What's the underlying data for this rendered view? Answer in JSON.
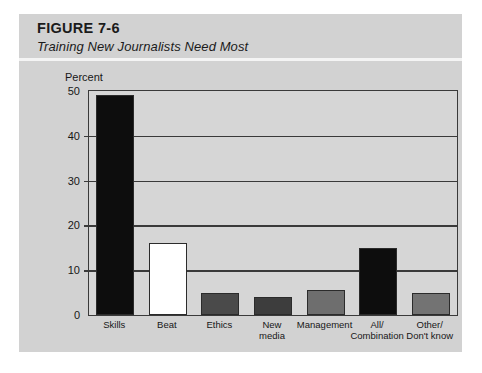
{
  "figure": {
    "number": "FIGURE 7-6",
    "subtitle": "Training New Journalists Need Most"
  },
  "chart_data": {
    "type": "bar",
    "title": "Training New Journalists Need Most",
    "xlabel": "",
    "ylabel": "Percent",
    "ylim": [
      0,
      50
    ],
    "yticks": [
      0,
      10,
      20,
      30,
      40,
      50
    ],
    "grid": true,
    "legend": "none",
    "categories": [
      "Skills",
      "Beat",
      "Ethics",
      "New\nmedia",
      "Management",
      "All/\nCombination",
      "Other/\nDon't know"
    ],
    "values": [
      49,
      16,
      5,
      4,
      5.5,
      15,
      5
    ],
    "bar_colors": [
      "#0d0d0d",
      "#ffffff",
      "#4a4a4a",
      "#3d3d3d",
      "#6e6e6e",
      "#0d0d0d",
      "#737373"
    ]
  },
  "colors": {
    "page_background": "#ffffff",
    "panel_background": "#d2d2d2",
    "plot_background": "#d6d6d6",
    "axis_line": "#3a3a3a",
    "text": "#171717"
  }
}
